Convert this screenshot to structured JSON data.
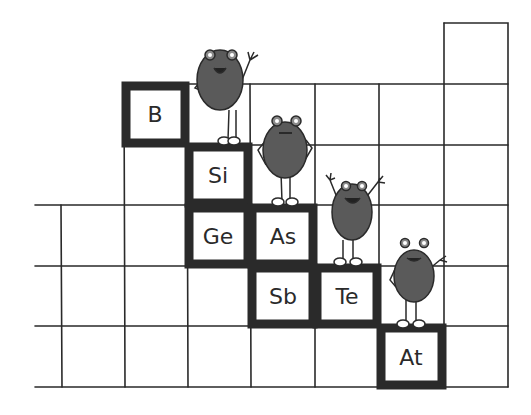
{
  "illustration": {
    "description": "Hand-drawn periodic table fragment showing metalloids with cartoon fuzzy creatures",
    "colors": {
      "ink": "#2a2a2a",
      "creature": "#5a5a5a",
      "background": "#ffffff"
    },
    "elements": [
      {
        "symbol": "B",
        "col": 1,
        "row": 0
      },
      {
        "symbol": "Si",
        "col": 2,
        "row": 1
      },
      {
        "symbol": "Ge",
        "col": 2,
        "row": 2
      },
      {
        "symbol": "As",
        "col": 3,
        "row": 2
      },
      {
        "symbol": "Sb",
        "col": 3,
        "row": 3
      },
      {
        "symbol": "Te",
        "col": 4,
        "row": 3
      },
      {
        "symbol": "At",
        "col": 5,
        "row": 4
      }
    ],
    "creatures": [
      {
        "name": "creature-waving",
        "pose": "one arm waving"
      },
      {
        "name": "creature-hands-on-hips",
        "pose": "hands on hips"
      },
      {
        "name": "creature-cheering",
        "pose": "both arms raised"
      },
      {
        "name": "creature-waving-right",
        "pose": "one hand on hip, one arm waving"
      }
    ]
  }
}
